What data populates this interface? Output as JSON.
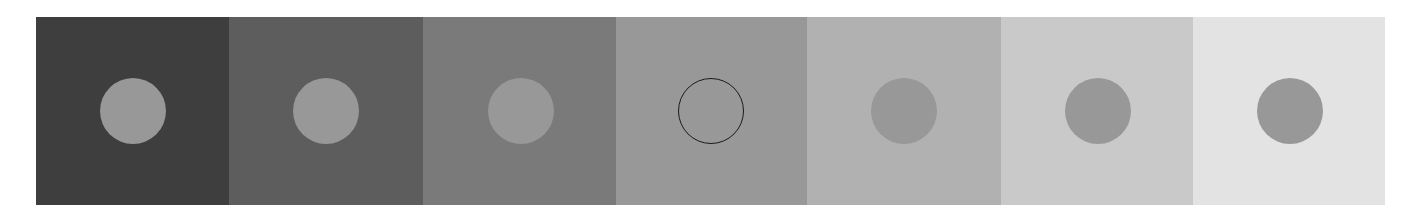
{
  "figure": {
    "panels": [
      {
        "background": "#3e3e3e",
        "disc": "#989898",
        "outlined": false,
        "width": 193
      },
      {
        "background": "#5d5d5d",
        "disc": "#989898",
        "outlined": false,
        "width": 194
      },
      {
        "background": "#7a7a7a",
        "disc": "#989898",
        "outlined": false,
        "width": 193
      },
      {
        "background": "#989898",
        "disc": "#989898",
        "outlined": true,
        "width": 191
      },
      {
        "background": "#b1b1b1",
        "disc": "#989898",
        "outlined": false,
        "width": 194
      },
      {
        "background": "#c9c9c9",
        "disc": "#989898",
        "outlined": false,
        "width": 192
      },
      {
        "background": "#e3e3e3",
        "disc": "#989898",
        "outlined": false,
        "width": 192
      }
    ],
    "disc_offsets": [
      64,
      64,
      65,
      62,
      64,
      64,
      64
    ]
  }
}
